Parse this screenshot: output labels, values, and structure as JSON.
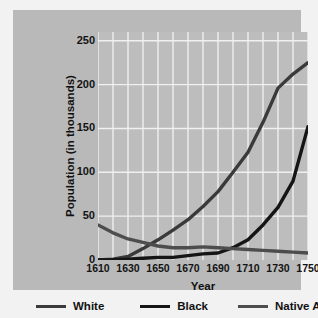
{
  "chart_data": {
    "type": "line",
    "title": "",
    "xlabel": "Year",
    "ylabel": "Population (in thousands)",
    "xlim": [
      1610,
      1750
    ],
    "ylim": [
      0,
      260
    ],
    "xticks": [
      1610,
      1630,
      1650,
      1670,
      1690,
      1710,
      1730,
      1750
    ],
    "yticks": [
      0,
      50,
      100,
      150,
      200,
      250
    ],
    "xtick_labels": [
      "1610",
      "1630",
      "1650",
      "1670",
      "1690",
      "1710",
      "1730",
      "1750"
    ],
    "ytick_labels": [
      "0",
      "50",
      "100",
      "150",
      "200",
      "250"
    ],
    "grid": true,
    "grid_color": "#f0f0f0",
    "grid_x_step": 10,
    "grid_y_step": 50,
    "legend_position": "below",
    "plot_background": "#bdbdbd",
    "panel_background": "#b9b9b9",
    "x": [
      1610,
      1620,
      1630,
      1640,
      1650,
      1660,
      1670,
      1680,
      1690,
      1700,
      1710,
      1720,
      1730,
      1740,
      1750
    ],
    "series": [
      {
        "name": "White",
        "color": "#3a3a3a",
        "values": [
          0,
          1,
          4,
          13,
          23,
          34,
          46,
          61,
          78,
          100,
          123,
          157,
          196,
          212,
          225
        ]
      },
      {
        "name": "Black",
        "color": "#151515",
        "values": [
          0,
          0,
          1,
          2,
          3,
          3,
          5,
          7,
          8,
          14,
          23,
          40,
          60,
          90,
          152
        ]
      },
      {
        "name": "Native American",
        "color": "#4d4d4d",
        "values": [
          40,
          31,
          24,
          20,
          16,
          14,
          14,
          15,
          14,
          13,
          12,
          11,
          10,
          9,
          8
        ]
      }
    ]
  },
  "legend": {
    "items": [
      {
        "label": "White",
        "color": "#3a3a3a"
      },
      {
        "label": "Black",
        "color": "#151515"
      },
      {
        "label": "Native American",
        "color": "#4d4d4d"
      }
    ]
  }
}
